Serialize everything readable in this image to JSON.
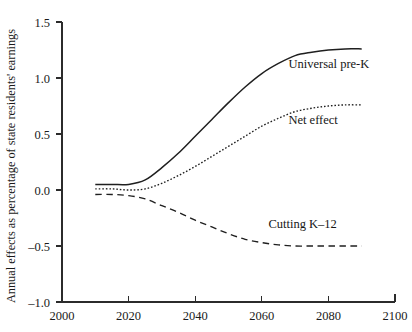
{
  "chart_data": {
    "type": "line",
    "title": "",
    "xlabel": "",
    "ylabel": "Annual effects as percentage of state residents' earnings",
    "xlim": [
      2000,
      2100
    ],
    "ylim": [
      -1.0,
      1.5
    ],
    "grid": false,
    "legend_position": "inline-annotations",
    "x_ticks": [
      "2000",
      "2020",
      "2040",
      "2060",
      "2080",
      "2100"
    ],
    "x_tick_values": [
      2000,
      2020,
      2040,
      2060,
      2080,
      2100
    ],
    "y_ticks": [
      "1.5",
      "1.0",
      "0.5",
      "0.0",
      "-0.5",
      "-1.0"
    ],
    "y_tick_values": [
      1.5,
      1.0,
      0.5,
      0.0,
      -0.5,
      -1.0
    ],
    "x": [
      2010,
      2015,
      2020,
      2025,
      2030,
      2035,
      2040,
      2045,
      2050,
      2055,
      2060,
      2065,
      2070,
      2075,
      2080,
      2085,
      2090
    ],
    "series": [
      {
        "name": "Universal pre-K",
        "style": "solid",
        "label": "Universal pre-K",
        "label_x": 2068,
        "label_y": 1.13,
        "values": [
          0.05,
          0.05,
          0.05,
          0.09,
          0.2,
          0.33,
          0.48,
          0.63,
          0.78,
          0.92,
          1.04,
          1.13,
          1.2,
          1.23,
          1.25,
          1.26,
          1.26
        ]
      },
      {
        "name": "Net effect",
        "style": "dotted",
        "label": "Net effect",
        "label_x": 2068,
        "label_y": 0.63,
        "values": [
          0.01,
          0.01,
          0.0,
          0.01,
          0.06,
          0.13,
          0.21,
          0.3,
          0.39,
          0.48,
          0.57,
          0.64,
          0.7,
          0.73,
          0.75,
          0.76,
          0.76
        ]
      },
      {
        "name": "Cutting K-12",
        "style": "dashed",
        "label": "Cutting K–12",
        "label_x": 2062,
        "label_y": -0.3,
        "values": [
          -0.04,
          -0.04,
          -0.05,
          -0.08,
          -0.14,
          -0.2,
          -0.27,
          -0.33,
          -0.39,
          -0.44,
          -0.47,
          -0.49,
          -0.5,
          -0.5,
          -0.5,
          -0.5,
          -0.5
        ]
      }
    ]
  },
  "colors": {
    "axis": "#2b2b2b",
    "line": "#1f1f1f",
    "text": "#1a1a1a",
    "background": "#ffffff"
  }
}
